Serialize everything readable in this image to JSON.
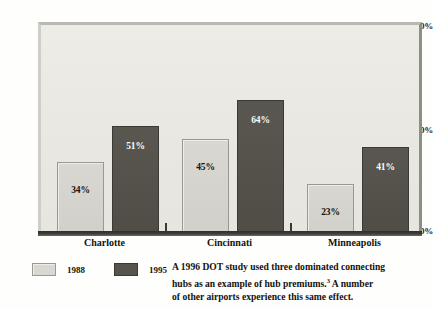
{
  "chart_data": {
    "type": "bar",
    "title": "",
    "subtitle": "",
    "xlabel": "",
    "ylabel": "",
    "categories": [
      "Charlotte",
      "Cincinnati",
      "Minneapolis"
    ],
    "series": [
      {
        "name": "1988",
        "values": [
          34,
          45,
          23
        ],
        "color": "#d9d7d1",
        "label_color": "#15140f"
      },
      {
        "name": "1995",
        "values": [
          51,
          64,
          41
        ],
        "color": "#56544d",
        "label_color": "#ffffff"
      }
    ],
    "value_labels": [
      [
        "34%",
        "45%",
        "23%"
      ],
      [
        "51%",
        "64%",
        "41%"
      ]
    ],
    "ylim": [
      0,
      100
    ],
    "yticks": [
      0,
      50,
      100
    ],
    "ytick_labels": [
      "0%",
      "50%",
      "100%"
    ],
    "grid": false,
    "legend_position": "below-left",
    "plot_background": "#e9e8e3",
    "axis_color": "#37352f"
  },
  "axis": {
    "y": [
      {
        "label": "100%",
        "value": 100
      },
      {
        "label": "50%",
        "value": 50
      },
      {
        "label": "0%",
        "value": 0
      }
    ]
  },
  "legend": {
    "items": [
      {
        "label": "1988",
        "swatch": "light"
      },
      {
        "label": "1995",
        "swatch": "dark"
      }
    ]
  },
  "caption": {
    "line1": "A 1996 DOT study used three dominated connecting",
    "line2_a": "hubs as an example of hub premiums.",
    "footnote_marker": "3",
    "line2_b": " A number",
    "line3": "of other airports experience this same effect."
  }
}
